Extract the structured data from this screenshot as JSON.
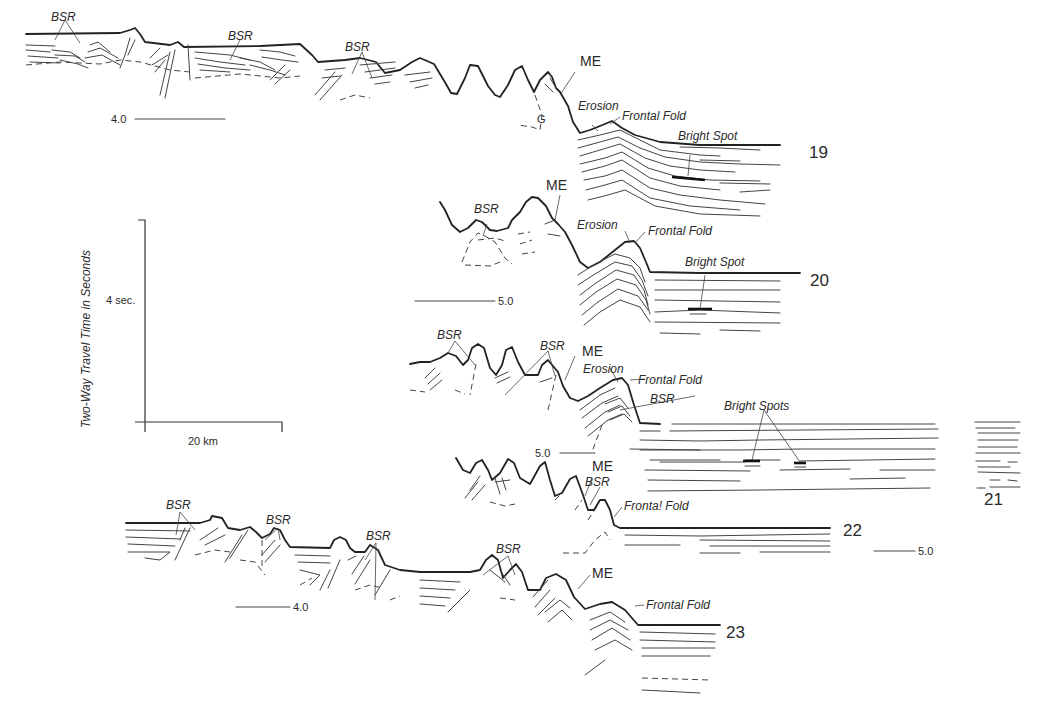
{
  "figure": {
    "type": "seismic line-drawing interpretations",
    "scale_bar": {
      "vertical_label": "4 sec.",
      "horizontal_label": "20 km",
      "axis_title": "Two-Way Travel Time in Seconds"
    },
    "profiles": [
      {
        "id": "19",
        "number_label": "19",
        "time_marker": "4.0",
        "labels": {
          "bsr": [
            "BSR",
            "BSR",
            "BSR"
          ],
          "me": "ME",
          "g": "G",
          "erosion": "Erosion",
          "frontal_fold": "Frontal Fold",
          "bright_spot": "Bright Spot"
        }
      },
      {
        "id": "20",
        "number_label": "20",
        "time_marker": "5.0",
        "labels": {
          "bsr": [
            "BSR"
          ],
          "me": "ME",
          "erosion": "Erosion",
          "frontal_fold": "Frontal Fold",
          "bright_spot": "Bright Spot"
        }
      },
      {
        "id": "21",
        "number_label": "21",
        "time_marker": "5.0",
        "labels": {
          "bsr": [
            "BSR",
            "BSR",
            "BSR"
          ],
          "me": "ME",
          "erosion": "Erosion",
          "frontal_fold": "Frontal Fold",
          "bright_spots": "Bright Spots"
        }
      },
      {
        "id": "22",
        "number_label": "22",
        "time_marker": "5.0",
        "labels": {
          "bsr": [
            "BSR"
          ],
          "me": "ME",
          "frontal_fold": "Fronta! Fold"
        }
      },
      {
        "id": "23",
        "number_label": "23",
        "time_marker": "4.0",
        "labels": {
          "bsr": [
            "BSR",
            "BSR",
            "BSR",
            "BSR"
          ],
          "me": "ME",
          "frontal_fold": "Frontal Fold"
        }
      }
    ]
  }
}
